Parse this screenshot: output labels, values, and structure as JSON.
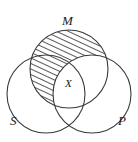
{
  "diagram": {
    "type": "venn-three-circle",
    "title": "",
    "background_color": "#ffffff",
    "stroke_color": "#3a3a3a",
    "hatch_color": "#111111",
    "labels": {
      "top_circle": "M",
      "bottom_left_circle": "S",
      "bottom_right_circle": "P",
      "center_mark": "X"
    },
    "circles": [
      {
        "name": "M",
        "label": "M",
        "cx": 69,
        "cy": 69,
        "r": 39,
        "shaded": true,
        "label_position": "top"
      },
      {
        "name": "S",
        "label": "S",
        "cx": 46,
        "cy": 94,
        "r": 39,
        "shaded": false,
        "label_position": "bottom-left"
      },
      {
        "name": "P",
        "label": "P",
        "cx": 92,
        "cy": 94,
        "r": 39,
        "shaded": false,
        "label_position": "bottom-right"
      }
    ],
    "shading": {
      "region": "M minus P",
      "pattern": "diagonal-hatch",
      "angle_degrees": 65,
      "spacing_px": 5,
      "line_width_px": 1.4
    },
    "center_mark": {
      "symbol": "X",
      "region": "M and S and P",
      "x": 70,
      "y": 84
    }
  }
}
